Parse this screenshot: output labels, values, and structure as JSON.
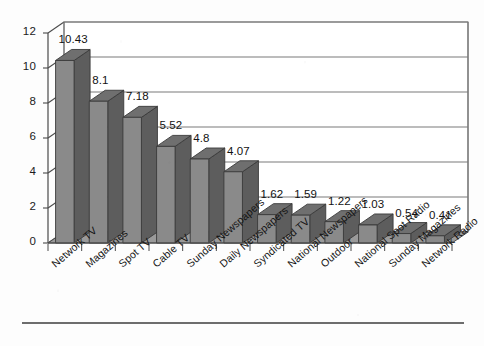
{
  "chart_data": {
    "type": "bar",
    "title": "",
    "subtitle": "",
    "xlabel": "",
    "ylabel": "",
    "ylim": [
      0,
      12
    ],
    "ytick_step": 2,
    "yticks": [
      "0",
      "2",
      "4",
      "6",
      "8",
      "10",
      "12"
    ],
    "grid": true,
    "grid_orientation": "horizontal",
    "legend": "none",
    "style": "3d-columns",
    "categories": [
      "Network TV",
      "Magazines",
      "Spot TV",
      "Cable TV",
      "Sunday Newspapers",
      "Daily Newspapers",
      "Syndicated TV",
      "National Newspapers",
      "Outdoor",
      "National Spot Radio",
      "Sunday Magazines",
      "Network Radio"
    ],
    "values": [
      10.43,
      8.1,
      7.18,
      5.52,
      4.8,
      4.07,
      1.62,
      1.59,
      1.22,
      1.03,
      0.54,
      0.41
    ],
    "data_labels": [
      "10.43",
      "8.1",
      "7.18",
      "5.52",
      "4.8",
      "4.07",
      "1.62",
      "1.59",
      "1.22",
      "1.03",
      "0.54",
      "0.41"
    ]
  },
  "colors": {
    "bar_front": "#8a8a8a",
    "bar_side": "#5d5d5d",
    "bar_top": "#6f6f6f",
    "floor": "#9a9a9a",
    "grid_line": "#7a7a7a",
    "axis_line": "#4a4a4a",
    "text": "#141414",
    "background": "#fdfdfd",
    "footer_rule": "#3c3c3c"
  },
  "footer": {
    "rule": "horizontal-rule"
  }
}
